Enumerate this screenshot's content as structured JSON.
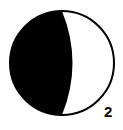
{
  "diagram": {
    "type": "moon-phase-icon",
    "phase_label": "2",
    "colors": {
      "dark": "#000000",
      "light": "#ffffff",
      "outline": "#000000"
    }
  }
}
